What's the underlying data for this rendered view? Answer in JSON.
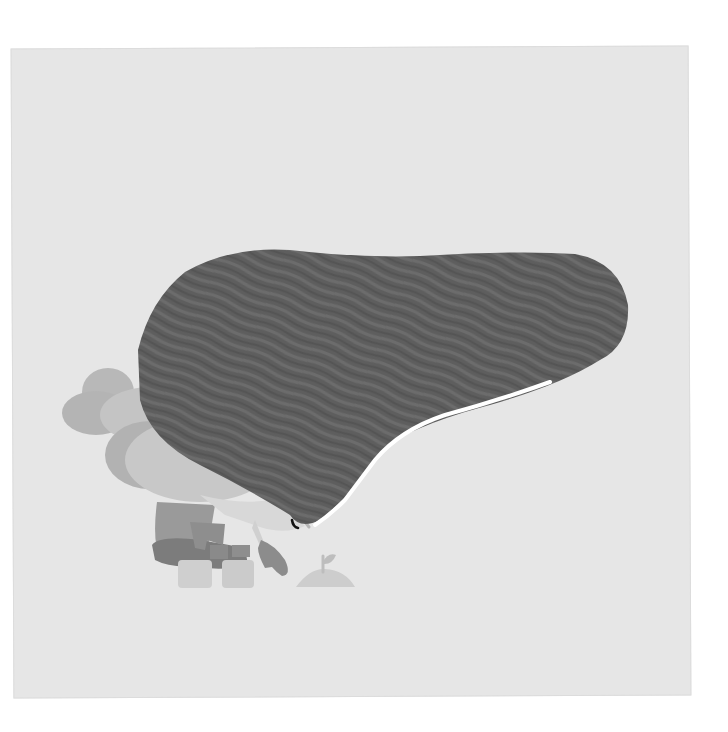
{
  "image": {
    "description": "Grayscale illustration of a small character crouching under a huge dark wavy-striped blob, beside a tiny sprout on a mound",
    "colors": {
      "page_background": "#ffffff",
      "panel_background": "#e6e6e6",
      "blob_dark": "#5c5c5c",
      "blob_stripe": "#6a6a6a",
      "blob_highlight": "#ffffff",
      "hair_light": "#b4b4b4",
      "hair_mid": "#a6a6a6",
      "face": "#d8d8d8",
      "body_dark": "#8a8a8a",
      "pants": "#7a7a7a",
      "boots": "#cfcfcf",
      "mound": "#cdcdcd",
      "eye": "#111111"
    }
  }
}
